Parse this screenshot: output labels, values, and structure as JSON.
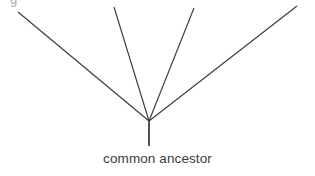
{
  "canvas": {
    "width": 315,
    "height": 176,
    "background_color": "#ffffff"
  },
  "diagram": {
    "type": "phylogenetic-tree",
    "line_color": "#3a3a3a",
    "stem_color": "#4a4a4a",
    "text_color": "#3c3c3c",
    "vertex": {
      "x": 149,
      "y": 121
    },
    "stem": {
      "x1": 149,
      "y1": 121,
      "x2": 149,
      "y2": 146
    },
    "branches": [
      {
        "name": "branch-1",
        "x1": 149,
        "y1": 121,
        "x2": 18,
        "y2": 12
      },
      {
        "name": "branch-2",
        "x1": 149,
        "y1": 121,
        "x2": 114,
        "y2": 7
      },
      {
        "name": "branch-3",
        "x1": 149,
        "y1": 121,
        "x2": 194,
        "y2": 8
      },
      {
        "name": "branch-4",
        "x1": 149,
        "y1": 121,
        "x2": 297,
        "y2": 6
      }
    ],
    "label": "common ancestor",
    "crop_artifact_glyph": "g"
  }
}
